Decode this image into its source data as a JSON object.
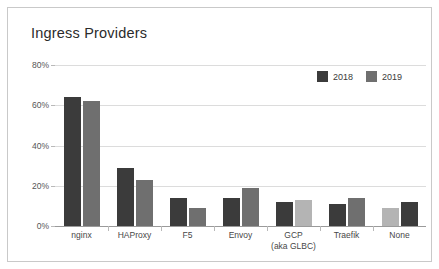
{
  "card": {
    "title": "Ingress Providers"
  },
  "legend": {
    "position": "top-right",
    "items": [
      {
        "label": "2018",
        "color": "#3b3b3b"
      },
      {
        "label": "2019",
        "color": "#6f6f6f"
      }
    ]
  },
  "axes": {
    "yticks": [
      "0%",
      "20%",
      "40%",
      "60%",
      "80%"
    ],
    "ytick_values": [
      0,
      20,
      40,
      60,
      80
    ]
  },
  "chart_data": {
    "type": "bar",
    "title": "Ingress Providers",
    "xlabel": "",
    "ylabel": "",
    "ylim": [
      0,
      80
    ],
    "yticks": [
      0,
      20,
      40,
      60,
      80
    ],
    "ytick_labels": [
      "0%",
      "20%",
      "40%",
      "60%",
      "80%"
    ],
    "grid": true,
    "value_unit": "percent",
    "legend_position": "top-right",
    "categories": [
      "nginx",
      "HAProxy",
      "F5",
      "Envoy",
      "GCP (aka GLBC)",
      "Traefik",
      "None"
    ],
    "category_lines": [
      [
        "nginx"
      ],
      [
        "HAProxy"
      ],
      [
        "F5"
      ],
      [
        "Envoy"
      ],
      [
        "GCP",
        "(aka GLBC)"
      ],
      [
        "Traefik"
      ],
      [
        "None"
      ]
    ],
    "series": [
      {
        "name": "2018",
        "color": "#3b3b3b",
        "values": [
          64,
          29,
          14,
          14,
          12,
          11,
          9
        ]
      },
      {
        "name": "2019",
        "color": "#6f6f6f",
        "values": [
          62,
          23,
          9,
          19,
          13,
          14,
          12
        ]
      }
    ]
  }
}
